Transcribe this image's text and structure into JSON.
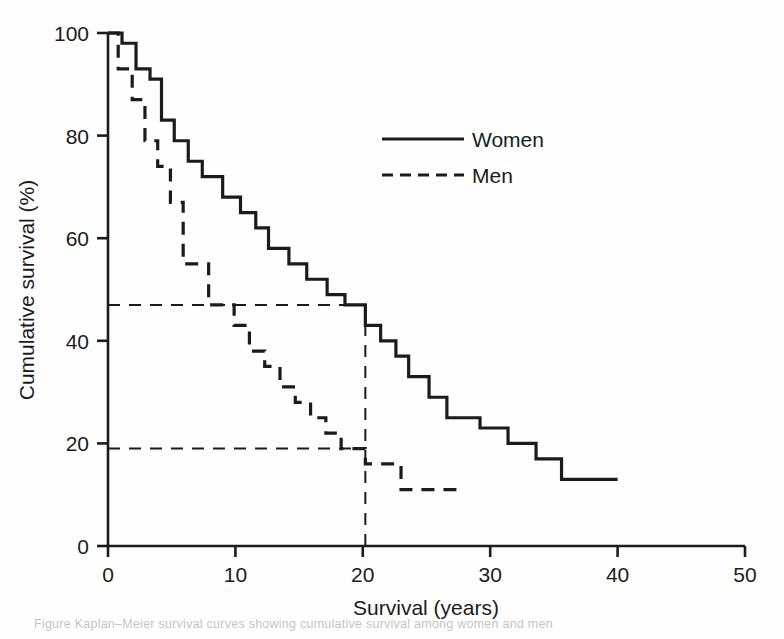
{
  "figure": {
    "background_color": "#fefefe",
    "ink_color": "#1b1b1b",
    "caption_partial": "Figure   Kaplan–Meier survival curves showing cumulative survival among women and men"
  },
  "chart_data": {
    "type": "line",
    "subtype": "kaplan-meier-step",
    "title": "",
    "subtitle": "",
    "xlabel": "Survival (years)",
    "ylabel": "Cumulative survival (%)",
    "xlim": [
      0,
      50
    ],
    "ylim": [
      0,
      100
    ],
    "xticks": [
      0,
      10,
      20,
      30,
      40,
      50
    ],
    "xtick_labels": [
      "0",
      "10",
      "20",
      "30",
      "40",
      "50"
    ],
    "yticks": [
      0,
      20,
      40,
      60,
      80,
      100
    ],
    "ytick_labels": [
      "0",
      "20",
      "40",
      "60",
      "80",
      "100"
    ],
    "grid": false,
    "legend_position": "top-right",
    "legend": [
      {
        "name": "Women",
        "style": "solid",
        "color": "#1b1b1b"
      },
      {
        "name": "Men",
        "style": "dashed",
        "color": "#1b1b1b"
      }
    ],
    "series": [
      {
        "name": "Women",
        "style": "solid",
        "color": "#1b1b1b",
        "line_width": 3.2,
        "points": [
          [
            0,
            100
          ],
          [
            1.1,
            100
          ],
          [
            1.1,
            98
          ],
          [
            2.2,
            98
          ],
          [
            2.2,
            93
          ],
          [
            3.3,
            93
          ],
          [
            3.3,
            91
          ],
          [
            4.2,
            91
          ],
          [
            4.2,
            83
          ],
          [
            5.2,
            83
          ],
          [
            5.2,
            79
          ],
          [
            6.3,
            79
          ],
          [
            6.3,
            75
          ],
          [
            7.4,
            75
          ],
          [
            7.4,
            72
          ],
          [
            9.0,
            72
          ],
          [
            9.0,
            68
          ],
          [
            10.4,
            68
          ],
          [
            10.4,
            65
          ],
          [
            11.6,
            65
          ],
          [
            11.6,
            62
          ],
          [
            12.6,
            62
          ],
          [
            12.6,
            58
          ],
          [
            14.2,
            58
          ],
          [
            14.2,
            55
          ],
          [
            15.6,
            55
          ],
          [
            15.6,
            52
          ],
          [
            17.2,
            52
          ],
          [
            17.2,
            49
          ],
          [
            18.6,
            49
          ],
          [
            18.6,
            47
          ],
          [
            20.2,
            47
          ],
          [
            20.2,
            43
          ],
          [
            21.4,
            43
          ],
          [
            21.4,
            40
          ],
          [
            22.6,
            40
          ],
          [
            22.6,
            37
          ],
          [
            23.6,
            37
          ],
          [
            23.6,
            33
          ],
          [
            25.2,
            33
          ],
          [
            25.2,
            29
          ],
          [
            26.6,
            29
          ],
          [
            26.6,
            25
          ],
          [
            29.2,
            25
          ],
          [
            29.2,
            23
          ],
          [
            31.4,
            23
          ],
          [
            31.4,
            20
          ],
          [
            33.6,
            20
          ],
          [
            33.6,
            17
          ],
          [
            35.6,
            17
          ],
          [
            35.6,
            13
          ],
          [
            40.0,
            13
          ]
        ]
      },
      {
        "name": "Men",
        "style": "dashed",
        "color": "#1b1b1b",
        "line_width": 3.2,
        "points": [
          [
            0,
            100
          ],
          [
            0.8,
            100
          ],
          [
            0.8,
            93
          ],
          [
            1.9,
            93
          ],
          [
            1.9,
            87
          ],
          [
            2.9,
            87
          ],
          [
            2.9,
            79
          ],
          [
            3.9,
            79
          ],
          [
            3.9,
            74
          ],
          [
            4.9,
            74
          ],
          [
            4.9,
            67
          ],
          [
            5.9,
            67
          ],
          [
            5.9,
            55
          ],
          [
            7.9,
            55
          ],
          [
            7.9,
            47
          ],
          [
            9.9,
            47
          ],
          [
            9.9,
            43
          ],
          [
            11.1,
            43
          ],
          [
            11.1,
            38
          ],
          [
            12.3,
            38
          ],
          [
            12.3,
            35
          ],
          [
            13.5,
            35
          ],
          [
            13.5,
            31
          ],
          [
            14.7,
            31
          ],
          [
            14.7,
            28
          ],
          [
            15.9,
            28
          ],
          [
            15.9,
            25
          ],
          [
            17.1,
            25
          ],
          [
            17.1,
            22
          ],
          [
            18.3,
            22
          ],
          [
            18.3,
            19
          ],
          [
            20.2,
            19
          ],
          [
            20.2,
            16
          ],
          [
            23.0,
            16
          ],
          [
            23.0,
            11
          ],
          [
            27.6,
            11
          ]
        ]
      }
    ],
    "reference_lines": [
      {
        "label": "women-20-year-survival",
        "orientation": "horizontal",
        "y": 47,
        "x_from": 0,
        "x_to": 20.2,
        "style": "dashed"
      },
      {
        "label": "men-20-year-survival",
        "orientation": "horizontal",
        "y": 19,
        "x_from": 0,
        "x_to": 20.2,
        "style": "dashed"
      },
      {
        "label": "20-year-marker",
        "orientation": "vertical",
        "x": 20.2,
        "y_from": 0,
        "y_to": 47,
        "style": "dashed"
      }
    ],
    "annotations": [
      {
        "text": "47",
        "kind": "reference-value",
        "x": 0,
        "y": 47,
        "rendered": false
      },
      {
        "text": "19",
        "kind": "reference-value",
        "x": 0,
        "y": 19,
        "rendered": false
      }
    ]
  }
}
